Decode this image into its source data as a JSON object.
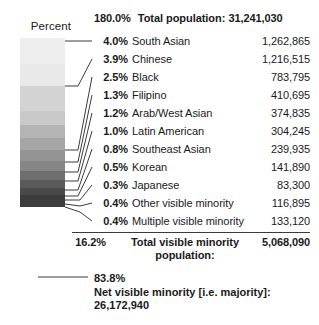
{
  "legend": {
    "axis_label": "Percent",
    "gradient": {
      "direction": "top-to-bottom light-to-dark",
      "bands": [
        "#eeeeee",
        "#e9e9e9",
        "#d3d3d3",
        "#c9c9c9",
        "#b4b4b4",
        "#a6a6a6",
        "#949494",
        "#868686",
        "#6e6e6e",
        "#5a5a5a",
        "#4a4a4a",
        "#3c3c3c"
      ]
    }
  },
  "header": {
    "percent": "180.0%",
    "label": "Total population:",
    "value": "31,241,030"
  },
  "rows": [
    {
      "percent": "4.0%",
      "label": "South Asian",
      "value": "1,262,865"
    },
    {
      "percent": "3.9%",
      "label": "Chinese",
      "value": "1,216,515"
    },
    {
      "percent": "2.5%",
      "label": "Black",
      "value": "783,795"
    },
    {
      "percent": "1.3%",
      "label": "Filipino",
      "value": "410,695"
    },
    {
      "percent": "1.2%",
      "label": "Arab/West Asian",
      "value": "374,835"
    },
    {
      "percent": "1.0%",
      "label": "Latin American",
      "value": "304,245"
    },
    {
      "percent": "0.8%",
      "label": "Southeast Asian",
      "value": "239,935"
    },
    {
      "percent": "0.5%",
      "label": "Korean",
      "value": "141,890"
    },
    {
      "percent": "0.3%",
      "label": "Japanese",
      "value": "83,300"
    },
    {
      "percent": "0.4%",
      "label": "Other visible minority",
      "value": "116,895"
    },
    {
      "percent": "0.4%",
      "label": "Multiple visible minority",
      "value": "133,120"
    }
  ],
  "summary": {
    "percent": "16.2%",
    "label": "Total visible minority population:",
    "value": "5,068,090"
  },
  "footer": {
    "percent": "83.8%",
    "label": "Net visible minority [i.e. majority]:",
    "value": "26,172,940"
  },
  "chart_data": {
    "type": "bar",
    "title": "Total population: 31,241,030",
    "xlabel": "",
    "ylabel": "Percent",
    "categories": [
      "South Asian",
      "Chinese",
      "Black",
      "Filipino",
      "Arab/West Asian",
      "Latin American",
      "Southeast Asian",
      "Korean",
      "Japanese",
      "Other visible minority",
      "Multiple visible minority"
    ],
    "values": [
      4.0,
      3.9,
      2.5,
      1.3,
      1.2,
      1.0,
      0.8,
      0.5,
      0.3,
      0.4,
      0.4
    ],
    "counts": [
      1262865,
      1216515,
      783795,
      410695,
      374835,
      304245,
      239935,
      141890,
      83300,
      116895,
      133120
    ],
    "total_population": 31241030,
    "total_visible_minority_percent": 16.2,
    "total_visible_minority_count": 5068090,
    "net_visible_minority_percent": 83.8,
    "net_visible_minority_count": 26172940,
    "grid": false,
    "legend_position": "left"
  }
}
